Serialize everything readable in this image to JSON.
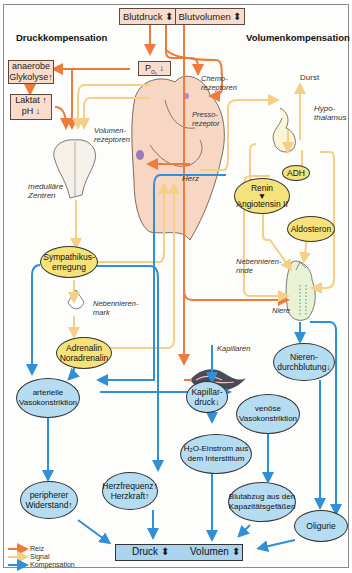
{
  "titles": {
    "left": "Druckkompensation",
    "right": "Volumenkompensation"
  },
  "top_boxes": {
    "blutdruck": "Blutdruck ⬍",
    "blutvolumen": "Blutvolumen ⬍",
    "po2": "P",
    "po2_sub": "O₂",
    "po2_arrow": "↓"
  },
  "left_boxes": {
    "glykolyse_line1": "anaerobe",
    "glykolyse_line2": "Glykolyse↑",
    "laktat_line1": "Laktat ↑",
    "laktat_line2": "pH ↓"
  },
  "organ_labels": {
    "chemorezeptoren": "Chemo-\nrezeptoren",
    "pressorezeptoren": "Presso-\nrezeptor",
    "volumenrezeptoren": "Volumen-\nrezeptoren",
    "herz": "Herz",
    "medullaere_zentren": "medulläre\nZentren",
    "durst": "Durst",
    "hypothalamus": "Hypo-\nthalamus",
    "nebennierenrinde": "Nebennieren-\nrinde",
    "nebennierenmark": "Nebennieren-\nmark",
    "niere": "Niere",
    "kapillaren": "Kapillaren"
  },
  "yellow_nodes": {
    "sympathikus": "Sympathikus-\nerregung",
    "adrenalin": "Adrenalin\nNoradrenalin",
    "adh": "ADH",
    "renin": "Renin\n▼\nAngiotensin II",
    "aldosteron": "Aldosteron"
  },
  "blue_nodes": {
    "arterielle": "arterielle\nVasokonstriktion",
    "kapillardruck": "Kapillar-\ndruck↓",
    "venoese": "venöse\nVasokonstriktion",
    "nierendurchblutung": "Nieren-\ndurchblutung↓",
    "h2o": "H₂O-Einstrom aus\ndem Interstitium",
    "peripherer": "peripherer\nWiderstand↑",
    "herzfrequenz": "Herzfrequenz↑\nHerzkraft↑",
    "blutabzug": "Blutabzug aus den\nKapazitätsgefäßen",
    "oligurie": "Oligurie"
  },
  "result_box": {
    "druck": "Druck ⬍",
    "volumen": "Volumen ⬍"
  },
  "legend": [
    {
      "label": "Reiz",
      "color": "#ee7a3c"
    },
    {
      "label": "Signal",
      "color": "#f5cf86"
    },
    {
      "label": "Kompensation",
      "color": "#2f8fd8"
    }
  ],
  "colors": {
    "reiz": "#ee7a3c",
    "signal": "#f5cf86",
    "kompensation": "#2f8fd8",
    "yellow_node": "#f6e27a",
    "blue_node": "#b6dcf2",
    "box_fill": "#f9dccb"
  }
}
